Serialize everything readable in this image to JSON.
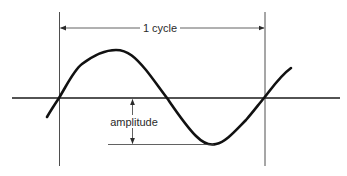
{
  "diagram": {
    "title_label": "1 cycle",
    "amplitude_label": "amplitude",
    "colors": {
      "background": "#ffffff",
      "ink": "#1a1a1a",
      "thin_line": "#3a3a3a"
    },
    "elements": {
      "horizontal_axis": "zero-line",
      "cycle_boundaries": [
        "left-cycle-marker",
        "right-cycle-marker"
      ],
      "waveform": "sine-wave"
    }
  }
}
